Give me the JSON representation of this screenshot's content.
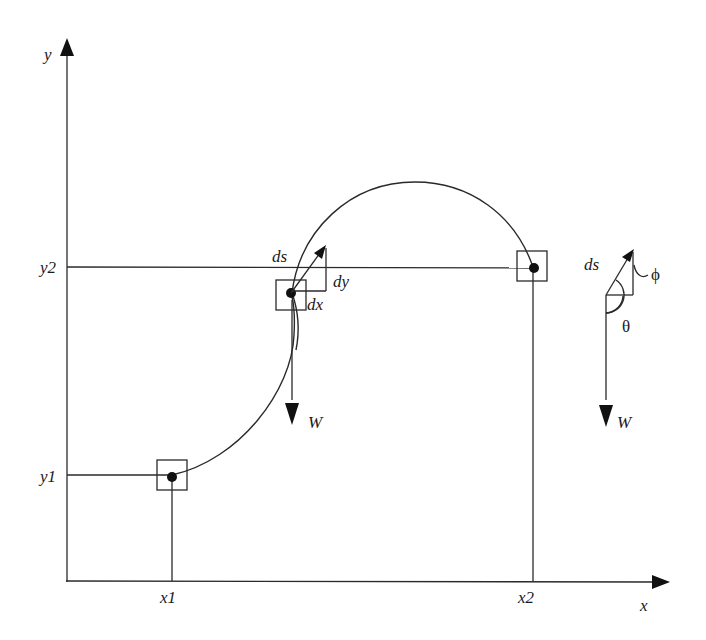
{
  "diagram": {
    "axes": {
      "x_label": "x",
      "y_label": "y",
      "x_ticks": [
        "x1",
        "x2"
      ],
      "y_ticks": [
        "y1",
        "y2"
      ]
    },
    "points": [
      {
        "name": "start",
        "x_label": "x1",
        "y_label": "y1"
      },
      {
        "name": "element",
        "labels": {
          "ds": "ds",
          "dx": "dx",
          "dy": "dy",
          "weight": "W"
        }
      },
      {
        "name": "end",
        "x_label": "x2",
        "y_label": "y2"
      }
    ],
    "inset": {
      "ds": "ds",
      "phi": "ϕ",
      "theta": "θ",
      "weight": "W"
    }
  }
}
